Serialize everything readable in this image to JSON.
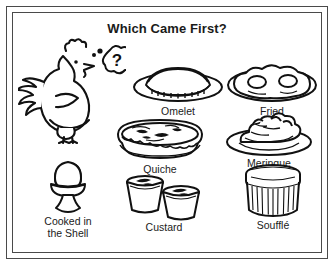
{
  "poster": {
    "title": "Which Came First?",
    "frame_color": "#4a4a4a",
    "ink_color": "#1a1a1a",
    "background_color": "#ffffff"
  },
  "character": {
    "name": "hen",
    "thought_bubble_text": "?"
  },
  "items": [
    {
      "id": "omelet",
      "label": "Omelet",
      "icon": "omelet-on-plate-icon"
    },
    {
      "id": "fried",
      "label": "Fried",
      "icon": "fried-eggs-on-plate-icon"
    },
    {
      "id": "quiche",
      "label": "Quiche",
      "icon": "quiche-pie-icon"
    },
    {
      "id": "meringue",
      "label": "Meringue",
      "icon": "meringue-on-plate-icon"
    },
    {
      "id": "shell",
      "label": "Cooked in\nthe Shell",
      "icon": "egg-in-egg-cup-icon"
    },
    {
      "id": "custard",
      "label": "Custard",
      "icon": "custard-cups-icon"
    },
    {
      "id": "souffle",
      "label": "Soufflé",
      "icon": "souffle-ramekin-icon"
    }
  ]
}
